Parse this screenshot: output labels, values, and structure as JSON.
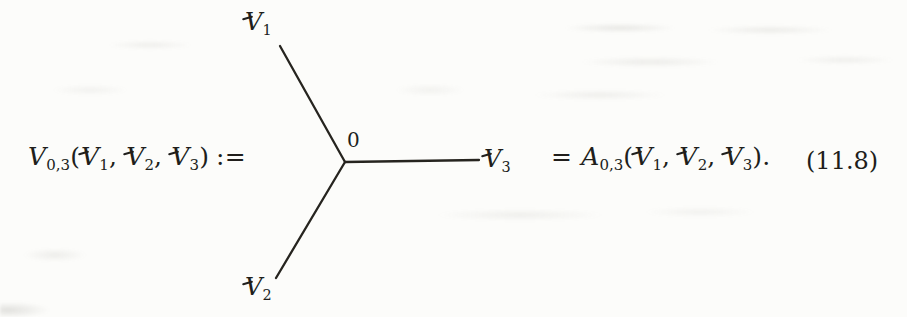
{
  "colors": {
    "ink": "#201e1b",
    "paper": "#fcfcfa"
  },
  "equation": {
    "number": "(11.8)",
    "lhs": {
      "func": {
        "main": "V",
        "sub": "0,3"
      },
      "open": "(",
      "args": [
        {
          "main": "V",
          "sub": "1",
          "sep": ", "
        },
        {
          "main": "V",
          "sub": "2",
          "sep": ", "
        },
        {
          "main": "V",
          "sub": "3",
          "sep": ""
        }
      ],
      "close": ")",
      "assign": ":="
    },
    "diagram": {
      "vertex_label": "0",
      "legs": [
        {
          "position": "top",
          "label": {
            "main": "V",
            "sub": "1"
          }
        },
        {
          "position": "bottom-left",
          "label": {
            "main": "V",
            "sub": "2"
          }
        },
        {
          "position": "right",
          "label": {
            "main": "V",
            "sub": "3"
          }
        }
      ]
    },
    "rhs": {
      "equals": "=",
      "func": {
        "main": "A",
        "sub": "0,3"
      },
      "open": "(",
      "args": [
        {
          "main": "V",
          "sub": "1",
          "sep": ", "
        },
        {
          "main": "V",
          "sub": "2",
          "sep": ", "
        },
        {
          "main": "V",
          "sub": "3",
          "sep": ""
        }
      ],
      "close": ")."
    }
  }
}
